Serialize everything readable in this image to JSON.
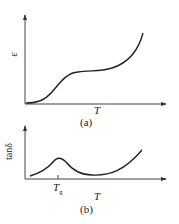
{
  "figure_a": {
    "y_label": "ε",
    "x_label": "T",
    "caption": "(a)",
    "description": "Permittivity ε vs temperature T: rises slowly, S-shaped step to a plateau, then rises steeply"
  },
  "figure_b": {
    "y_label": "tanδ",
    "x_label": "T",
    "tick_label": "T",
    "tick_sub": "g",
    "caption": "(b)",
    "description": "Loss tangent tanδ vs temperature T: peak near Tg, minimum, then steep rise"
  },
  "colors": {
    "line": "#222222",
    "background": "#ffffff"
  }
}
